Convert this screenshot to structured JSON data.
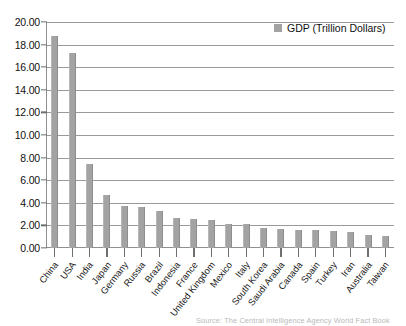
{
  "chart_data": {
    "type": "bar",
    "title": "",
    "xlabel": "",
    "ylabel": "",
    "ylim": [
      0,
      20
    ],
    "ytick_step": 2,
    "grid": true,
    "legend_position": "top-right",
    "series_name": "GDP (Trillion Dollars)",
    "bar_color": "#a3a3a3",
    "ytick_labels": [
      "0.00",
      "2.00",
      "4.00",
      "6.00",
      "8.00",
      "10.00",
      "12.00",
      "14.00",
      "16.00",
      "18.00",
      "20.00"
    ],
    "categories": [
      "China",
      "USA",
      "India",
      "Japan",
      "Germany",
      "Russia",
      "Brazil",
      "Indonesia",
      "France",
      "United Kingdom",
      "Mexico",
      "Italy",
      "South Korea",
      "Saudi Arabia",
      "Canada",
      "Spain",
      "Turkey",
      "Iran",
      "Australia",
      "Taiwan"
    ],
    "values": [
      18.8,
      17.3,
      7.4,
      4.7,
      3.75,
      3.6,
      3.25,
      2.65,
      2.55,
      2.5,
      2.1,
      2.1,
      1.8,
      1.7,
      1.6,
      1.6,
      1.55,
      1.4,
      1.15,
      1.1
    ],
    "annotations": [
      "Source: The Central Intelligence Agency World Fact Book"
    ]
  },
  "legend": {
    "label": "GDP (Trillion Dollars)"
  },
  "source": {
    "text": "Source: The Central Intelligence Agency World Fact Book"
  }
}
